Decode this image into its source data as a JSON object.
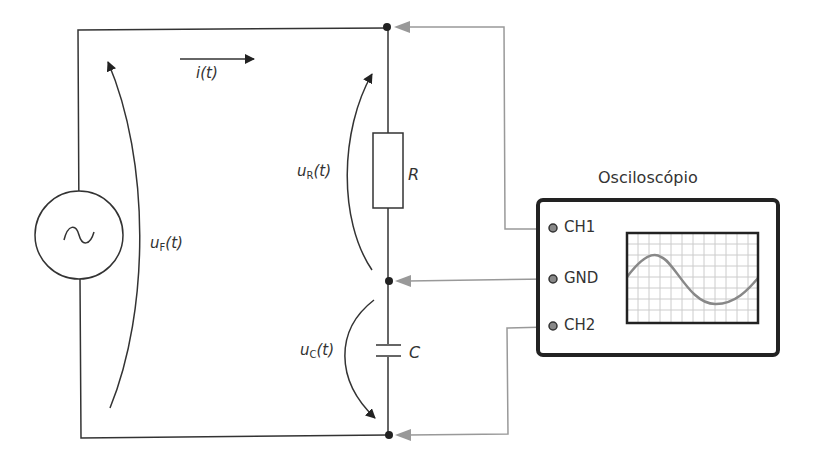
{
  "diagram": {
    "type": "RC series circuit with oscilloscope",
    "labels": {
      "current": "i(t)",
      "source_voltage_main": "u",
      "source_voltage_sub": "F",
      "source_voltage_tail": "(t)",
      "resistor_voltage_main": "u",
      "resistor_voltage_sub": "R",
      "resistor_voltage_tail": "(t)",
      "capacitor_voltage_main": "u",
      "capacitor_voltage_sub": "C",
      "capacitor_voltage_tail": "(t)",
      "resistor": "R",
      "capacitor": "C"
    },
    "oscilloscope": {
      "title": "Osciloscópio",
      "terminals": [
        {
          "label": "CH1"
        },
        {
          "label": "GND"
        },
        {
          "label": "CH2"
        }
      ],
      "screen_grid": {
        "columns": 12,
        "rows": 8
      },
      "waveform": "sine"
    },
    "colors": {
      "wire": "#333333",
      "probe": "#999999",
      "frame": "#222222",
      "grid": "#cccccc",
      "wave": "#888888"
    }
  }
}
